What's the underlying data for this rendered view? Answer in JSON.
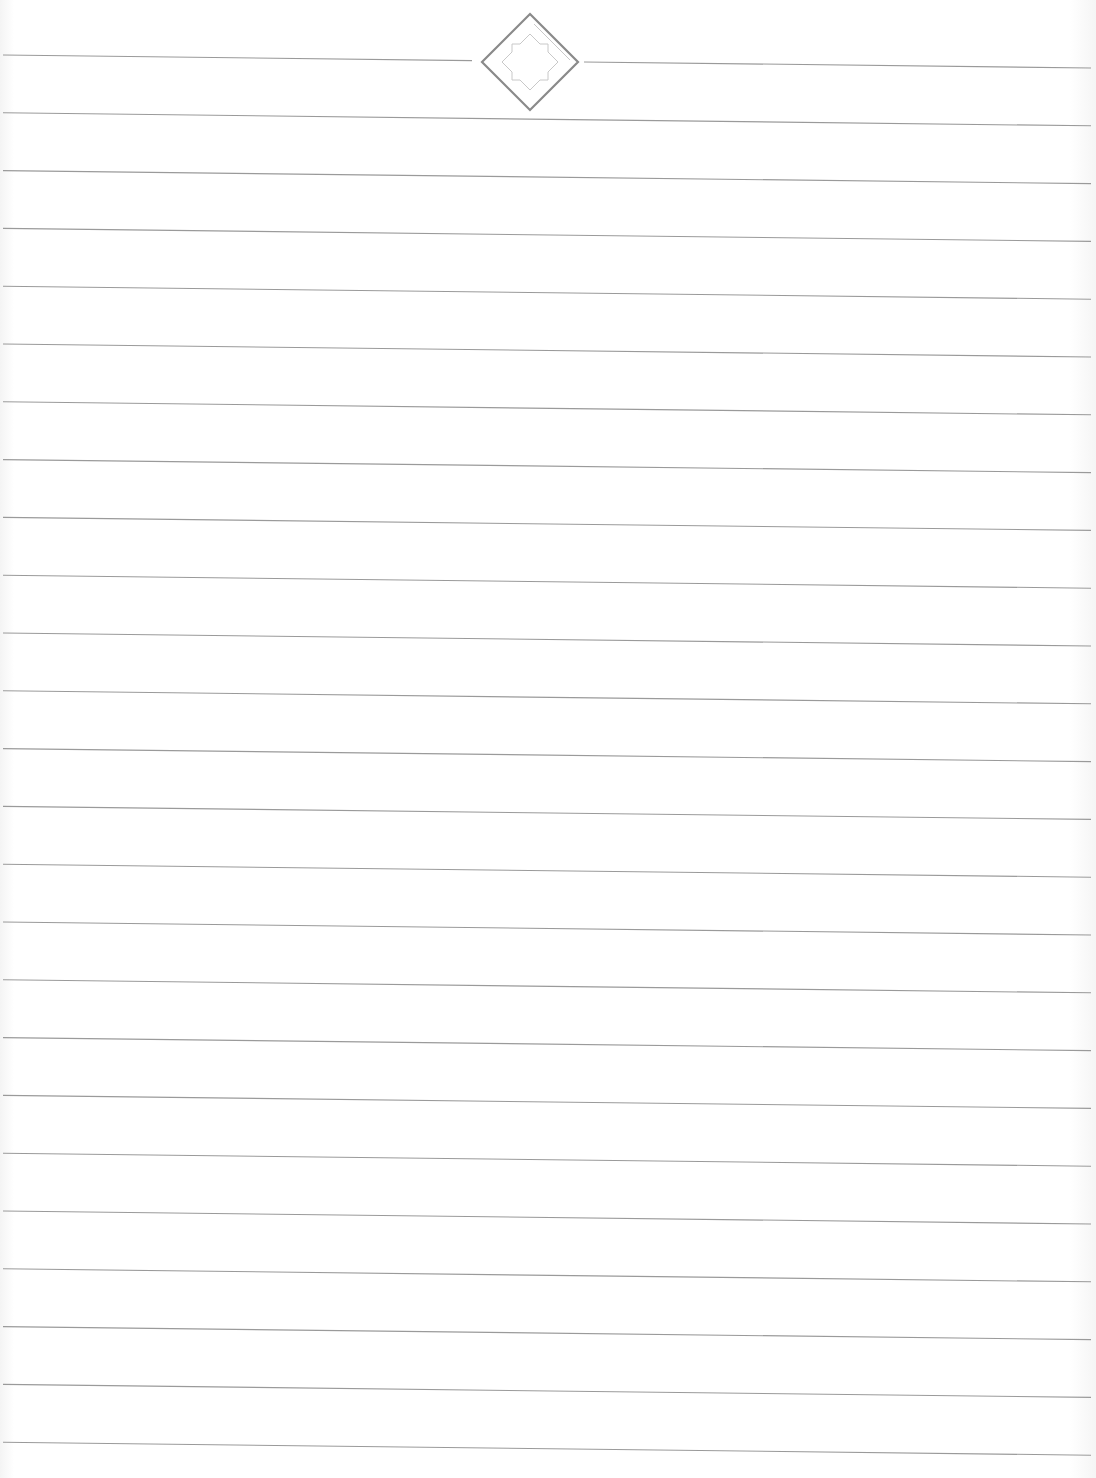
{
  "document": {
    "type": "lined-paper",
    "line_count": 25,
    "line_color": "#9a9a9a",
    "first_line_y_left": 55,
    "line_spacing": 57.8,
    "tilt_px": 13,
    "line_x_start": 3,
    "line_x_end": 1091
  },
  "ornament": {
    "icon": "diamond-star-ornament",
    "center_x": 530,
    "center_y": 62,
    "half_size": 48,
    "color": "#8a8a8a",
    "inner_color": "#c8c8c8",
    "gap_left_x": 472,
    "gap_right_x": 584
  }
}
